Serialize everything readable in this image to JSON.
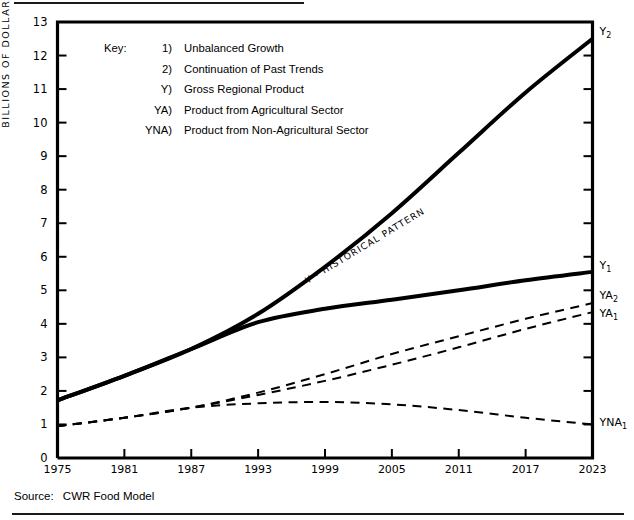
{
  "chart_data": {
    "type": "line",
    "title": "",
    "xlabel": "",
    "ylabel": "BILLIONS OF DOLLARS",
    "xlim": [
      1975,
      2023
    ],
    "ylim": [
      0,
      13
    ],
    "grid": false,
    "legend_position": "inside-upper-left",
    "x_tick_labels": [
      "1975",
      "1981",
      "1987",
      "1993",
      "1999",
      "2005",
      "2011",
      "2017",
      "2023"
    ],
    "y_tick_labels": [
      "0",
      "1",
      "2",
      "3",
      "4",
      "5",
      "6",
      "7",
      "8",
      "9",
      "10",
      "11",
      "12",
      "13"
    ],
    "x": [
      1975,
      1981,
      1987,
      1993,
      1999,
      2005,
      2011,
      2017,
      2023
    ],
    "series": [
      {
        "name": "Y2",
        "label": "Y",
        "subscript": "2",
        "style": "solid",
        "width": 4,
        "values": [
          1.72,
          2.45,
          3.25,
          4.3,
          5.7,
          7.3,
          9.1,
          10.9,
          12.5
        ]
      },
      {
        "name": "Y1",
        "label": "Y",
        "subscript": "1",
        "style": "solid",
        "width": 4,
        "values": [
          1.72,
          2.45,
          3.25,
          4.05,
          4.45,
          4.72,
          5.0,
          5.3,
          5.55
        ]
      },
      {
        "name": "YA2",
        "label": "YA",
        "subscript": "2",
        "style": "dashed",
        "width": 2,
        "values": [
          0.95,
          1.2,
          1.5,
          1.95,
          2.5,
          3.1,
          3.63,
          4.15,
          4.62
        ]
      },
      {
        "name": "YA1",
        "label": "YA",
        "subscript": "1",
        "style": "dashed",
        "width": 2,
        "values": [
          0.95,
          1.2,
          1.5,
          1.88,
          2.3,
          2.78,
          3.3,
          3.85,
          4.35
        ]
      },
      {
        "name": "YNA1",
        "label": "YNA",
        "subscript": "1",
        "style": "dashed",
        "width": 2,
        "values": [
          0.95,
          1.2,
          1.5,
          1.63,
          1.67,
          1.6,
          1.43,
          1.2,
          1.0
        ]
      }
    ],
    "annotations": [
      {
        "text": "Y - HISTORICAL PATTERN",
        "rotation": -31
      }
    ],
    "colors": {
      "line": "#000000",
      "axis": "#000000",
      "background": "#ffffff"
    }
  },
  "legend": {
    "key_word": "Key:",
    "rows": [
      {
        "tag": "1)",
        "desc": "Unbalanced Growth"
      },
      {
        "tag": "2)",
        "desc": "Continuation of Past Trends"
      },
      {
        "tag": "Y)",
        "desc": "Gross Regional Product"
      },
      {
        "tag": "YA)",
        "desc": "Product from Agricultural Sector"
      },
      {
        "tag": "YNA)",
        "desc": "Product from Non-Agricultural Sector"
      }
    ]
  },
  "source": {
    "label": "Source:",
    "value": "CWR Food Model"
  }
}
